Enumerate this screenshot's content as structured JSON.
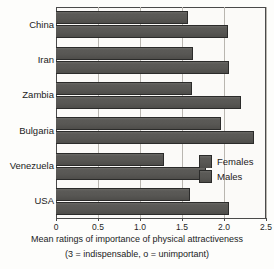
{
  "chart_data": {
    "type": "bar",
    "orientation": "horizontal",
    "title": "",
    "xlabel": "Mean ratings of importance of physical attractiveness",
    "xlabel_note": "(3 = indispensable, o = unimportant)",
    "ylabel": "",
    "categories": [
      "China",
      "Iran",
      "Zambia",
      "Bulgaria",
      "Venezuela",
      "USA"
    ],
    "series": [
      {
        "name": "Females",
        "values": [
          1.57,
          1.63,
          1.62,
          1.97,
          1.29,
          1.6
        ]
      },
      {
        "name": "Males",
        "values": [
          2.05,
          2.06,
          2.2,
          2.36,
          1.79,
          2.06
        ]
      }
    ],
    "xlim": [
      0,
      2.5
    ],
    "xticks": [
      0,
      0.5,
      1.0,
      1.5,
      2.0,
      2.5
    ],
    "xtick_labels": [
      "0",
      "0.5",
      "1.0",
      "1.5",
      "2.0",
      "2.5"
    ],
    "grid": true,
    "grid_axis": "x",
    "legend_position": "inside-right",
    "legend_entries": [
      "Females",
      "Males"
    ],
    "bar_color": "#575653",
    "bar_edge_color": "#2b2b2a",
    "plot_background": "#fbfaf8",
    "frame_color": "#4a4a4a",
    "gridline_color": "#b9b6b0"
  }
}
